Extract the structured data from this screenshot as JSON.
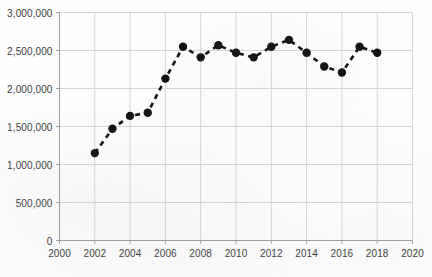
{
  "chart_data": {
    "type": "line",
    "title": "",
    "subtitle": "",
    "xlabel": "",
    "ylabel": "",
    "xlim": [
      2000,
      2020
    ],
    "ylim": [
      0,
      3000000
    ],
    "grid": true,
    "legend": "none",
    "marker": "filled-circle",
    "line_style": "dashed",
    "series_color": "#111111",
    "grid_color": "#d6d6d6",
    "axis_color": "#bdbdbd",
    "x_ticks": [
      2000,
      2002,
      2004,
      2006,
      2008,
      2010,
      2012,
      2014,
      2016,
      2018,
      2020
    ],
    "x_tick_labels": [
      "2000",
      "2002",
      "2004",
      "2006",
      "2008",
      "2010",
      "2012",
      "2014",
      "2016",
      "2018",
      "2020"
    ],
    "y_ticks": [
      0,
      500000,
      1000000,
      1500000,
      2000000,
      2500000,
      3000000
    ],
    "y_tick_labels": [
      "0",
      "500,000",
      "1,000,000",
      "1,500,000",
      "2,000,000",
      "2,500,000",
      "3,000,000"
    ],
    "x": [
      2002,
      2003,
      2004,
      2005,
      2006,
      2007,
      2008,
      2009,
      2010,
      2011,
      2012,
      2013,
      2014,
      2015,
      2016,
      2017,
      2018
    ],
    "values": [
      1150000,
      1470000,
      1640000,
      1680000,
      2130000,
      2550000,
      2410000,
      2570000,
      2470000,
      2410000,
      2550000,
      2640000,
      2470000,
      2290000,
      2210000,
      2550000,
      2470000
    ],
    "series": [
      {
        "name": "",
        "values": [
          1150000,
          1470000,
          1640000,
          1680000,
          2130000,
          2550000,
          2410000,
          2570000,
          2470000,
          2410000,
          2550000,
          2640000,
          2470000,
          2290000,
          2210000,
          2550000,
          2470000
        ]
      }
    ]
  }
}
